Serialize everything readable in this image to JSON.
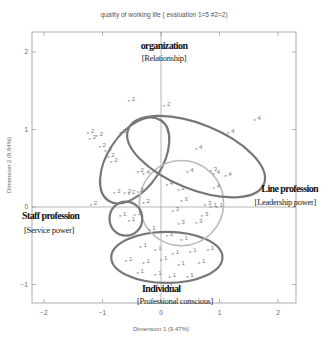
{
  "chart_data": {
    "type": "scatter",
    "title": "quality of working life ( evaluation 1=5 #2=2)",
    "xlabel": "Dimension 1 (9.47%)",
    "ylabel": "Dimension 2 (8.84%)",
    "xlim": [
      -2.2,
      2.3
    ],
    "ylim": [
      -1.25,
      2.25
    ],
    "xticks": [
      "-2",
      "-1",
      "0",
      "1",
      "2"
    ],
    "yticks": [
      "2",
      "1",
      "0",
      "-1"
    ],
    "grid": false,
    "reference_lines": {
      "x": 0,
      "y": 0
    },
    "groups": [
      {
        "id": "1",
        "label": "Individual",
        "sublabel": "[Professional conscious]",
        "ellipse": {
          "cx": 0.1,
          "cy": -0.65,
          "rx": 0.95,
          "ry": 0.33,
          "angle": 0,
          "color": "#777777"
        }
      },
      {
        "id": "2",
        "label": "Staff profession",
        "sublabel": "[Service power]",
        "ellipse": {
          "cx": -0.45,
          "cy": 0.6,
          "rx": 0.82,
          "ry": 0.35,
          "angle": 57,
          "color": "#777777"
        }
      },
      {
        "id": "3",
        "label": "Line profession",
        "sublabel": "[Leadership power]",
        "ellipse": {
          "cx": 0.35,
          "cy": 0.05,
          "rx": 0.72,
          "ry": 0.55,
          "angle": 0,
          "color": "#bbbbbb"
        }
      },
      {
        "id": "4",
        "label": "organization",
        "sublabel": "[Relationship]",
        "ellipse": {
          "cx": 0.6,
          "cy": 0.65,
          "rx": 1.25,
          "ry": 0.42,
          "angle": -22,
          "color": "#777777"
        }
      },
      {
        "id": "5",
        "label": "",
        "sublabel": "",
        "ellipse": {
          "cx": -0.6,
          "cy": -0.15,
          "rx": 0.28,
          "ry": 0.22,
          "angle": 0,
          "color": "#777777"
        }
      }
    ],
    "points": [
      {
        "x": -0.55,
        "y": 1.37,
        "g": "2"
      },
      {
        "x": -1.25,
        "y": 0.95,
        "g": "2"
      },
      {
        "x": -1.1,
        "y": 0.92,
        "g": "2"
      },
      {
        "x": -1.22,
        "y": 0.88,
        "g": "2"
      },
      {
        "x": -1.05,
        "y": 0.78,
        "g": "2"
      },
      {
        "x": -0.95,
        "y": 0.72,
        "g": "2"
      },
      {
        "x": -0.9,
        "y": 0.65,
        "g": "2"
      },
      {
        "x": -0.85,
        "y": 0.58,
        "g": "2"
      },
      {
        "x": -0.7,
        "y": 0.95,
        "g": "3"
      },
      {
        "x": -0.4,
        "y": 0.45,
        "g": "2"
      },
      {
        "x": -0.3,
        "y": 0.42,
        "g": "4"
      },
      {
        "x": -0.8,
        "y": 0.18,
        "g": "2"
      },
      {
        "x": -0.62,
        "y": 0.18,
        "g": "2"
      },
      {
        "x": -0.55,
        "y": 0.17,
        "g": "2"
      },
      {
        "x": -1.2,
        "y": 0.03,
        "g": "2"
      },
      {
        "x": -0.4,
        "y": 0.2,
        "g": "3"
      },
      {
        "x": -0.3,
        "y": 0.05,
        "g": "2"
      },
      {
        "x": 0.05,
        "y": 1.3,
        "g": "2"
      },
      {
        "x": 1.6,
        "y": 1.12,
        "g": "4"
      },
      {
        "x": 1.15,
        "y": 0.95,
        "g": "4"
      },
      {
        "x": 0.6,
        "y": 0.75,
        "g": "4"
      },
      {
        "x": 0.45,
        "y": 0.45,
        "g": "4"
      },
      {
        "x": 0.85,
        "y": 0.47,
        "g": "3"
      },
      {
        "x": 0.9,
        "y": 0.42,
        "g": "4"
      },
      {
        "x": 1.1,
        "y": 0.4,
        "g": "4"
      },
      {
        "x": 0.9,
        "y": 0.25,
        "g": "4"
      },
      {
        "x": 0.1,
        "y": 0.28,
        "g": "4"
      },
      {
        "x": 0.3,
        "y": 0.22,
        "g": "2"
      },
      {
        "x": 0.35,
        "y": 0.08,
        "g": "3"
      },
      {
        "x": 0.75,
        "y": 0.03,
        "g": "3"
      },
      {
        "x": 0.85,
        "y": 0.0,
        "g": "1"
      },
      {
        "x": 0.95,
        "y": 0.0,
        "g": "1"
      },
      {
        "x": 0.2,
        "y": -0.05,
        "g": "3"
      },
      {
        "x": 0.7,
        "y": -0.12,
        "g": "3"
      },
      {
        "x": 0.6,
        "y": -0.2,
        "g": "3"
      },
      {
        "x": 0.3,
        "y": -0.22,
        "g": "3"
      },
      {
        "x": -0.2,
        "y": -0.3,
        "g": "1"
      },
      {
        "x": 0.1,
        "y": -0.38,
        "g": "1"
      },
      {
        "x": 0.35,
        "y": -0.42,
        "g": "1"
      },
      {
        "x": -0.35,
        "y": -0.52,
        "g": "1"
      },
      {
        "x": -0.1,
        "y": -0.55,
        "g": "1"
      },
      {
        "x": 0.2,
        "y": -0.6,
        "g": "1"
      },
      {
        "x": 0.5,
        "y": -0.58,
        "g": "1"
      },
      {
        "x": 0.8,
        "y": -0.55,
        "g": "1"
      },
      {
        "x": -0.6,
        "y": -0.7,
        "g": "1"
      },
      {
        "x": -0.3,
        "y": -0.72,
        "g": "1"
      },
      {
        "x": 0.0,
        "y": -0.68,
        "g": "1"
      },
      {
        "x": 0.3,
        "y": -0.75,
        "g": "1"
      },
      {
        "x": 0.65,
        "y": -0.72,
        "g": "1"
      },
      {
        "x": -0.4,
        "y": -0.85,
        "g": "1"
      },
      {
        "x": -0.1,
        "y": -0.88,
        "g": "1"
      },
      {
        "x": 0.15,
        "y": -0.9,
        "g": "1"
      },
      {
        "x": 0.45,
        "y": -0.9,
        "g": "1"
      },
      {
        "x": 0.1,
        "y": -1.05,
        "g": "1"
      },
      {
        "x": -0.7,
        "y": -0.12,
        "g": "1"
      },
      {
        "x": -0.55,
        "y": -0.18,
        "g": "1"
      },
      {
        "x": -0.45,
        "y": -0.1,
        "g": "1"
      }
    ]
  },
  "labels": {
    "title": "quality of working life ( evaluation 1=5 #2=2)",
    "xlabel": "Dimension 1 (9.47%)",
    "ylabel": "Dimension 2 (8.84%)",
    "xticks": [
      "-2",
      "-1",
      "0",
      "1",
      "2"
    ],
    "yticks": [
      "2",
      "1",
      "0",
      "-1"
    ],
    "organization": "organization",
    "organization_sub": "[Relationship]",
    "line": "Line profession",
    "line_sub": "[Leadership power]",
    "staff": "Staff profession",
    "staff_sub": "[Service power]",
    "individual": "Individual",
    "individual_sub": "[Professional conscious]"
  }
}
